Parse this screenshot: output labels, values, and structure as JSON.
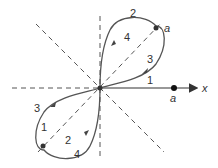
{
  "diagram": {
    "type": "polar-curve-two-lobes",
    "colors": {
      "curve": "#555555",
      "axis": "#333333",
      "dashed": "#555555",
      "text": "#333333"
    },
    "axis_label": "x",
    "point_labels": {
      "upper_lobe_tip": "a",
      "x_axis_point": "a"
    },
    "upper_lobe_labels": {
      "outer_top": "2",
      "inner_left": "4",
      "inner_right": "3",
      "lower_edge": "1"
    },
    "lower_lobe_labels": {
      "outer_left": "3",
      "inner_left": "1",
      "inner_bottom": "2",
      "outer_bottom": "4"
    }
  }
}
